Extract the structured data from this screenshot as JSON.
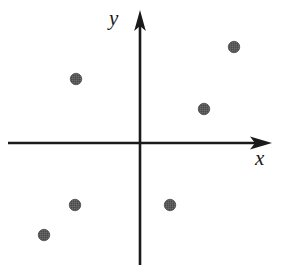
{
  "figure": {
    "title": "",
    "background_color": "#ffffff",
    "width": 284,
    "height": 273
  },
  "axes": {
    "x": {
      "label": "x",
      "label_icon": "x-axis-label-icon",
      "color": "#1a1a1a",
      "origin_px": [
        140,
        143
      ],
      "start_px": [
        8,
        143
      ],
      "arrow_tip_px": [
        272,
        143
      ]
    },
    "y": {
      "label": "y",
      "label_icon": "y-axis-label-icon",
      "color": "#1a1a1a",
      "origin_px": [
        140,
        143
      ],
      "start_px": [
        140,
        265
      ],
      "arrow_tip_px": [
        140,
        10
      ]
    }
  },
  "chart_data": {
    "type": "scatter",
    "title": "",
    "xlabel": "x",
    "ylabel": "y",
    "grid": false,
    "legend": null,
    "axis_style": "arrow-ended cartesian axes through origin",
    "tick_labels": {
      "x": [],
      "y": []
    },
    "xlim": [
      -6.6,
      6.6
    ],
    "ylim": [
      -6.1,
      6.65
    ],
    "units_per_pixel": 0.05,
    "marker": {
      "shape": "circle",
      "color": "#595959",
      "edge_color": "#4d4d4d",
      "diameter_px": 11.5,
      "fill": "dithered-gray"
    },
    "series": [
      {
        "name": "points",
        "points": [
          {
            "id": "p1",
            "x": 4.7,
            "y": 4.8,
            "px": [
              234,
              47
            ],
            "quadrant": "I"
          },
          {
            "id": "p2",
            "x": 3.2,
            "y": 1.7,
            "px": [
              204,
              109
            ],
            "quadrant": "I"
          },
          {
            "id": "p3",
            "x": -3.2,
            "y": 3.2,
            "px": [
              76,
              79
            ],
            "quadrant": "II"
          },
          {
            "id": "p4",
            "x": -4.8,
            "y": -4.6,
            "px": [
              44,
              235
            ],
            "quadrant": "III"
          },
          {
            "id": "p5",
            "x": -3.25,
            "y": -3.1,
            "px": [
              75,
              205
            ],
            "quadrant": "III"
          },
          {
            "id": "p6",
            "x": 1.5,
            "y": -3.1,
            "px": [
              170,
              205
            ],
            "quadrant": "IV"
          }
        ]
      }
    ]
  }
}
